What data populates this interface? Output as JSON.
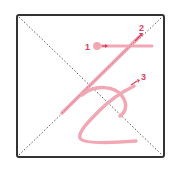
{
  "diagram": {
    "frame": {
      "x": 16,
      "y": 14,
      "w": 149,
      "h": 144,
      "stroke": "#333333",
      "radius": 2
    },
    "diagonal_color": "#555555",
    "stroke_color": "#f2a7b4",
    "accent_color": "#e0405e",
    "labels": [
      {
        "id": "1",
        "text": "1"
      },
      {
        "id": "2",
        "text": "2"
      },
      {
        "id": "3",
        "text": "3"
      }
    ]
  }
}
